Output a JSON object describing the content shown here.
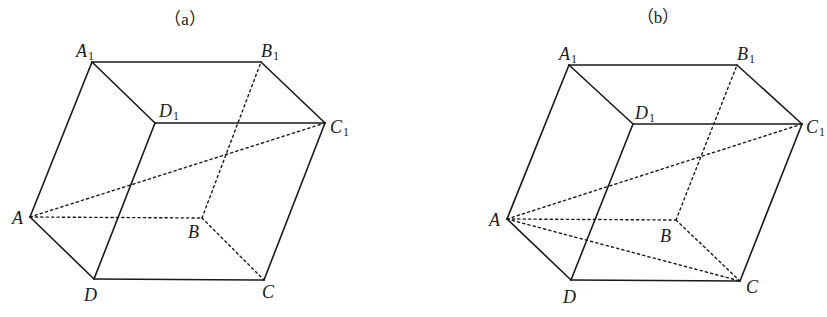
{
  "figure": {
    "width": 827,
    "height": 317,
    "line_color": "#1a1a1a",
    "background": "#ffffff"
  },
  "diagrams": [
    {
      "id": "a",
      "title": "（a）",
      "title_pos": [
        185,
        25
      ],
      "vertices": {
        "A1": [
          92,
          62
        ],
        "B1": [
          261,
          62
        ],
        "D1": [
          155,
          123
        ],
        "C1": [
          325,
          123
        ],
        "A": [
          30,
          217
        ],
        "B": [
          202,
          218
        ],
        "D": [
          94,
          279
        ],
        "C": [
          264,
          280
        ]
      },
      "labels": [
        {
          "vertex": "A1",
          "main": "A",
          "sub": "1",
          "pos": [
            76,
            57
          ]
        },
        {
          "vertex": "B1",
          "main": "B",
          "sub": "1",
          "pos": [
            261,
            57
          ]
        },
        {
          "vertex": "D1",
          "main": "D",
          "sub": "1",
          "pos": [
            159,
            117
          ]
        },
        {
          "vertex": "C1",
          "main": "C",
          "sub": "1",
          "pos": [
            330,
            133
          ]
        },
        {
          "vertex": "A",
          "main": "A",
          "sub": "",
          "pos": [
            12,
            224
          ]
        },
        {
          "vertex": "B",
          "main": "B",
          "sub": "",
          "pos": [
            188,
            238
          ]
        },
        {
          "vertex": "D",
          "main": "D",
          "sub": "",
          "pos": [
            84,
            301
          ]
        },
        {
          "vertex": "C",
          "main": "C",
          "sub": "",
          "pos": [
            262,
            298
          ]
        }
      ],
      "solid_edges": [
        [
          "A1",
          "B1"
        ],
        [
          "B1",
          "C1"
        ],
        [
          "C1",
          "D1"
        ],
        [
          "D1",
          "A1"
        ],
        [
          "A",
          "A1"
        ],
        [
          "D",
          "D1"
        ],
        [
          "C",
          "C1"
        ],
        [
          "A",
          "D"
        ],
        [
          "D",
          "C"
        ]
      ],
      "dashed_edges": [
        [
          "A",
          "B"
        ],
        [
          "B",
          "C"
        ],
        [
          "B",
          "B1"
        ],
        [
          "A",
          "C1"
        ]
      ]
    },
    {
      "id": "b",
      "title": "（b）",
      "title_pos": [
        658,
        23
      ],
      "vertices": {
        "A1": [
          569,
          65
        ],
        "B1": [
          737,
          65
        ],
        "D1": [
          633,
          124
        ],
        "C1": [
          802,
          124
        ],
        "A": [
          507,
          219
        ],
        "B": [
          676,
          220
        ],
        "D": [
          571,
          280
        ],
        "C": [
          740,
          281
        ]
      },
      "labels": [
        {
          "vertex": "A1",
          "main": "A",
          "sub": "1",
          "pos": [
            559,
            60
          ]
        },
        {
          "vertex": "B1",
          "main": "B",
          "sub": "1",
          "pos": [
            737,
            60
          ]
        },
        {
          "vertex": "D1",
          "main": "D",
          "sub": "1",
          "pos": [
            635,
            119
          ]
        },
        {
          "vertex": "C1",
          "main": "C",
          "sub": "1",
          "pos": [
            806,
            133
          ]
        },
        {
          "vertex": "A",
          "main": "A",
          "sub": "",
          "pos": [
            489,
            226
          ]
        },
        {
          "vertex": "B",
          "main": "B",
          "sub": "",
          "pos": [
            660,
            242
          ]
        },
        {
          "vertex": "D",
          "main": "D",
          "sub": "",
          "pos": [
            563,
            303
          ]
        },
        {
          "vertex": "C",
          "main": "C",
          "sub": "",
          "pos": [
            746,
            293
          ]
        }
      ],
      "solid_edges": [
        [
          "A1",
          "B1"
        ],
        [
          "B1",
          "C1"
        ],
        [
          "C1",
          "D1"
        ],
        [
          "D1",
          "A1"
        ],
        [
          "A",
          "A1"
        ],
        [
          "D",
          "D1"
        ],
        [
          "C",
          "C1"
        ],
        [
          "A",
          "D"
        ],
        [
          "D",
          "C"
        ]
      ],
      "dashed_edges": [
        [
          "A",
          "B"
        ],
        [
          "B",
          "C"
        ],
        [
          "B",
          "B1"
        ],
        [
          "A",
          "C1"
        ],
        [
          "A",
          "C"
        ]
      ]
    }
  ]
}
